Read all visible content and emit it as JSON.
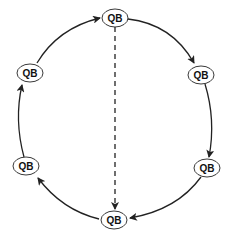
{
  "diagram": {
    "type": "cycle",
    "colors": {
      "stroke": "#222222",
      "node_fill": "#ffffff",
      "background": "#ffffff"
    },
    "nodes": [
      {
        "id": "top",
        "label": "QB",
        "cx": 115,
        "cy": 18
      },
      {
        "id": "upper-right",
        "label": "QB",
        "cx": 201,
        "cy": 75
      },
      {
        "id": "lower-right",
        "label": "QB",
        "cx": 207,
        "cy": 168
      },
      {
        "id": "bottom",
        "label": "QB",
        "cx": 114,
        "cy": 220
      },
      {
        "id": "lower-left",
        "label": "QB",
        "cx": 26,
        "cy": 166
      },
      {
        "id": "upper-left",
        "label": "QB",
        "cx": 30,
        "cy": 73
      }
    ],
    "edges": [
      {
        "from": "top",
        "to": "upper-right",
        "style": "solid"
      },
      {
        "from": "upper-right",
        "to": "lower-right",
        "style": "solid"
      },
      {
        "from": "lower-right",
        "to": "bottom",
        "style": "solid"
      },
      {
        "from": "bottom",
        "to": "lower-left",
        "style": "solid"
      },
      {
        "from": "lower-left",
        "to": "upper-left",
        "style": "solid"
      },
      {
        "from": "upper-left",
        "to": "top",
        "style": "solid"
      },
      {
        "from": "top",
        "to": "bottom",
        "style": "dashed"
      }
    ]
  }
}
